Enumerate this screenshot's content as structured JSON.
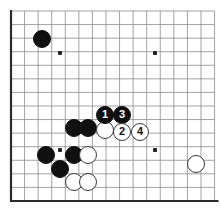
{
  "diagram": {
    "type": "go-board-diagram",
    "board": {
      "background_color": "#ffffff",
      "line_color": "#8c8c8c",
      "edge_color": "#2b2b2b",
      "grid_spacing": 13.57,
      "origin_x": 11,
      "origin_y": 11,
      "cols": 16,
      "rows": 15,
      "edges": [
        "left",
        "bottom"
      ],
      "star_points": [
        {
          "x": 60,
          "y": 53
        },
        {
          "x": 155,
          "y": 53
        },
        {
          "x": 60,
          "y": 150
        },
        {
          "x": 155,
          "y": 150
        }
      ]
    },
    "stones": [
      {
        "color": "black",
        "x": 42,
        "y": 39,
        "label": "",
        "name": "stone-black-corner"
      },
      {
        "color": "black",
        "x": 74,
        "y": 128,
        "label": "",
        "name": "stone-black-a"
      },
      {
        "color": "black",
        "x": 88,
        "y": 128,
        "label": "",
        "name": "stone-black-b"
      },
      {
        "color": "black",
        "x": 46,
        "y": 155,
        "label": "",
        "name": "stone-black-c"
      },
      {
        "color": "black",
        "x": 74,
        "y": 155,
        "label": "",
        "name": "stone-black-d"
      },
      {
        "color": "black",
        "x": 60,
        "y": 169,
        "label": "",
        "name": "stone-black-e"
      },
      {
        "color": "white",
        "x": 88,
        "y": 155,
        "label": "",
        "name": "stone-white-a"
      },
      {
        "color": "white",
        "x": 74,
        "y": 182,
        "label": "",
        "name": "stone-white-b"
      },
      {
        "color": "white",
        "x": 88,
        "y": 182,
        "label": "",
        "name": "stone-white-c"
      },
      {
        "color": "white",
        "x": 196,
        "y": 164,
        "label": "",
        "name": "stone-white-d"
      },
      {
        "color": "black",
        "x": 105,
        "y": 115,
        "label": "1",
        "name": "stone-move-1"
      },
      {
        "color": "black",
        "x": 122,
        "y": 115,
        "label": "3",
        "name": "stone-move-3"
      },
      {
        "color": "white",
        "x": 105,
        "y": 130,
        "label": "",
        "name": "stone-white-contact"
      },
      {
        "color": "white",
        "x": 122,
        "y": 132,
        "label": "2",
        "name": "stone-move-2"
      },
      {
        "color": "white",
        "x": 140,
        "y": 132,
        "label": "4",
        "name": "stone-move-4"
      }
    ],
    "move_numbers": [
      "1",
      "2",
      "3",
      "4"
    ],
    "stone_radius": 9.2
  }
}
